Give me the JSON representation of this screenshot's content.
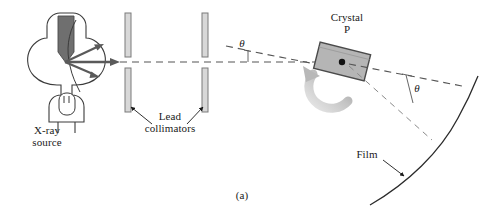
{
  "figure": {
    "caption": "(a)",
    "title_description": "X-ray diffraction apparatus: X-ray source, lead collimators, rotating crystal and film arc"
  },
  "labels": {
    "xray_source": "X-ray\nsource",
    "lead_collimators": "Lead\ncollimators",
    "crystal": "Crystal\nP",
    "film": "Film",
    "theta_incident": "θ",
    "theta_reflected": "θ"
  },
  "colors": {
    "outline": "#3b3b3b",
    "dark_outline": "#1a1a1a",
    "anode_fill": "#6f6f6f",
    "collimator_fill": "#d8d8d8",
    "collimator_stroke": "#7a7a7a",
    "crystal_fill": "#b5b5b5",
    "crystal_stroke": "#4a4a4a",
    "beam_arrow": "#5a5a5a",
    "rotation_arrow": "#c0c0c0",
    "dashed_line": "#555555",
    "text": "#1a1a1a",
    "background": "#ffffff"
  },
  "components": {
    "xray_tube": {
      "name": "x-ray-tube-envelope",
      "anode": "angled-anode-target",
      "cathode": "filament-cathode"
    },
    "beams": [
      {
        "name": "beam-ray-upper",
        "direction": "up-right"
      },
      {
        "name": "beam-ray-center",
        "direction": "horizontal"
      },
      {
        "name": "beam-ray-lower",
        "direction": "down-right"
      }
    ],
    "collimators": [
      {
        "name": "collimator-plate-1-top"
      },
      {
        "name": "collimator-plate-1-bottom"
      },
      {
        "name": "collimator-plate-2-top"
      },
      {
        "name": "collimator-plate-2-bottom"
      }
    ],
    "crystal": {
      "name": "crystal-specimen",
      "center_point": "crystal-center-dot",
      "rotation": "counterclockwise"
    },
    "film": {
      "name": "film-arc",
      "shape": "curved-arc"
    }
  }
}
